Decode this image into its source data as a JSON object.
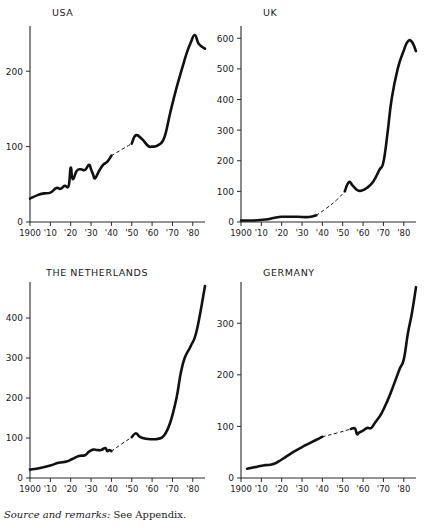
{
  "figure": {
    "caption_lead": "Source and remarks:",
    "caption_rest": " See Appendix."
  },
  "chart_data": [
    {
      "type": "line",
      "title": "USA",
      "xlabel": "",
      "ylabel": "",
      "xlim": [
        1900,
        1986
      ],
      "ylim": [
        0,
        260
      ],
      "yticks": [
        0,
        100,
        200
      ],
      "ytick_labels": [
        "0",
        "100",
        "200"
      ],
      "xticks": [
        1900,
        1910,
        1920,
        1930,
        1940,
        1950,
        1960,
        1970,
        1980
      ],
      "xtick_labels": [
        "1900",
        "'10",
        "'20",
        "'30",
        "'40",
        "'50",
        "'60",
        "'70",
        "'80"
      ],
      "grid": false,
      "legend": "none",
      "series": [
        {
          "name": "USA",
          "style": "solid",
          "x": [
            1900,
            1904,
            1907,
            1910,
            1913,
            1915,
            1917,
            1919,
            1920,
            1921,
            1923,
            1925,
            1927,
            1929,
            1930,
            1931,
            1932,
            1934,
            1936,
            1938,
            1940
          ],
          "values": [
            31,
            36,
            38,
            39,
            45,
            44,
            48,
            48,
            72,
            57,
            68,
            70,
            69,
            76,
            70,
            63,
            58,
            68,
            76,
            80,
            88
          ]
        },
        {
          "name": "USA-interpolated",
          "style": "dashed",
          "x": [
            1940,
            1945,
            1950
          ],
          "values": [
            88,
            96,
            104
          ]
        },
        {
          "name": "USA-postwar",
          "style": "solid",
          "x": [
            1950,
            1952,
            1955,
            1958,
            1960,
            1963,
            1966,
            1969,
            1972,
            1975,
            1977,
            1979,
            1981,
            1983,
            1986
          ],
          "values": [
            104,
            115,
            110,
            101,
            100,
            102,
            112,
            146,
            178,
            206,
            224,
            238,
            248,
            236,
            230
          ]
        }
      ]
    },
    {
      "type": "line",
      "title": "UK",
      "xlabel": "",
      "ylabel": "",
      "xlim": [
        1900,
        1986
      ],
      "ylim": [
        0,
        640
      ],
      "yticks": [
        0,
        100,
        200,
        300,
        400,
        500,
        600
      ],
      "ytick_labels": [
        "0",
        "100",
        "200",
        "300",
        "400",
        "500",
        "600"
      ],
      "xticks": [
        1900,
        1910,
        1920,
        1930,
        1940,
        1950,
        1960,
        1970,
        1980
      ],
      "xtick_labels": [
        "1900",
        "'10",
        "'20",
        "'30",
        "'40",
        "'50",
        "'60",
        "'70",
        "'80"
      ],
      "grid": false,
      "legend": "none",
      "series": [
        {
          "name": "UK",
          "style": "solid",
          "x": [
            1900,
            1906,
            1912,
            1916,
            1920,
            1924,
            1928,
            1932,
            1935,
            1937
          ],
          "values": [
            5,
            5,
            8,
            13,
            17,
            17,
            17,
            16,
            18,
            22
          ]
        },
        {
          "name": "UK-interpolated",
          "style": "dashed",
          "x": [
            1937,
            1942,
            1947,
            1951
          ],
          "values": [
            22,
            45,
            72,
            100
          ]
        },
        {
          "name": "UK-postwar",
          "style": "solid",
          "x": [
            1951,
            1953,
            1955,
            1957,
            1959,
            1962,
            1965,
            1968,
            1970,
            1972,
            1974,
            1977,
            1980,
            1982,
            1984,
            1986
          ],
          "values": [
            100,
            130,
            118,
            105,
            102,
            112,
            132,
            170,
            196,
            290,
            400,
            500,
            560,
            590,
            588,
            558
          ]
        }
      ]
    },
    {
      "type": "line",
      "title": "THE NETHERLANDS",
      "xlabel": "",
      "ylabel": "",
      "xlim": [
        1900,
        1986
      ],
      "ylim": [
        0,
        490
      ],
      "yticks": [
        0,
        100,
        200,
        300,
        400
      ],
      "ytick_labels": [
        "0",
        "100",
        "200",
        "300",
        "400"
      ],
      "xticks": [
        1900,
        1910,
        1920,
        1930,
        1940,
        1950,
        1960,
        1970,
        1980
      ],
      "xtick_labels": [
        "1900",
        "'10",
        "'20",
        "'30",
        "'40",
        "'50",
        "'60",
        "'70",
        "'80"
      ],
      "grid": false,
      "legend": "none",
      "series": [
        {
          "name": "Netherlands",
          "style": "solid",
          "x": [
            1900,
            1905,
            1910,
            1914,
            1918,
            1921,
            1924,
            1927,
            1929,
            1931,
            1933,
            1935,
            1937,
            1938,
            1939,
            1940
          ],
          "values": [
            21,
            25,
            31,
            38,
            41,
            48,
            55,
            57,
            66,
            71,
            70,
            70,
            75,
            67,
            70,
            67
          ]
        },
        {
          "name": "Netherlands-interpolated",
          "style": "dashed",
          "x": [
            1940,
            1945,
            1950
          ],
          "values": [
            67,
            85,
            102
          ]
        },
        {
          "name": "Netherlands-postwar",
          "style": "solid",
          "x": [
            1950,
            1952,
            1954,
            1957,
            1960,
            1963,
            1966,
            1969,
            1972,
            1974,
            1976,
            1979,
            1982,
            1986
          ],
          "values": [
            102,
            112,
            103,
            98,
            97,
            98,
            107,
            140,
            200,
            260,
            300,
            330,
            370,
            480
          ]
        }
      ]
    },
    {
      "type": "line",
      "title": "GERMANY",
      "xlabel": "",
      "ylabel": "",
      "xlim": [
        1900,
        1986
      ],
      "ylim": [
        0,
        380
      ],
      "yticks": [
        0,
        100,
        200,
        300
      ],
      "ytick_labels": [
        "0",
        "100",
        "200",
        "300"
      ],
      "xticks": [
        1900,
        1910,
        1920,
        1930,
        1940,
        1950,
        1960,
        1970,
        1980
      ],
      "xtick_labels": [
        "1900",
        "'10",
        "'20",
        "'30",
        "'40",
        "'50",
        "'60",
        "'70",
        "'80"
      ],
      "grid": false,
      "legend": "none",
      "series": [
        {
          "name": "Germany",
          "style": "solid",
          "x": [
            1903,
            1908,
            1912,
            1915,
            1918,
            1922,
            1926,
            1930,
            1934,
            1938,
            1940
          ],
          "values": [
            18,
            22,
            25,
            26,
            31,
            41,
            51,
            60,
            68,
            76,
            80
          ]
        },
        {
          "name": "Germany-interpolated",
          "style": "dashed",
          "x": [
            1940,
            1947,
            1954
          ],
          "values": [
            80,
            87,
            95
          ]
        },
        {
          "name": "Germany-postwar",
          "style": "solid",
          "x": [
            1954,
            1956,
            1957,
            1958,
            1960,
            1962,
            1964,
            1966,
            1969,
            1972,
            1975,
            1978,
            1980,
            1982,
            1984,
            1986
          ],
          "values": [
            95,
            96,
            85,
            88,
            92,
            97,
            97,
            108,
            125,
            150,
            180,
            212,
            230,
            280,
            320,
            370
          ]
        }
      ]
    }
  ]
}
